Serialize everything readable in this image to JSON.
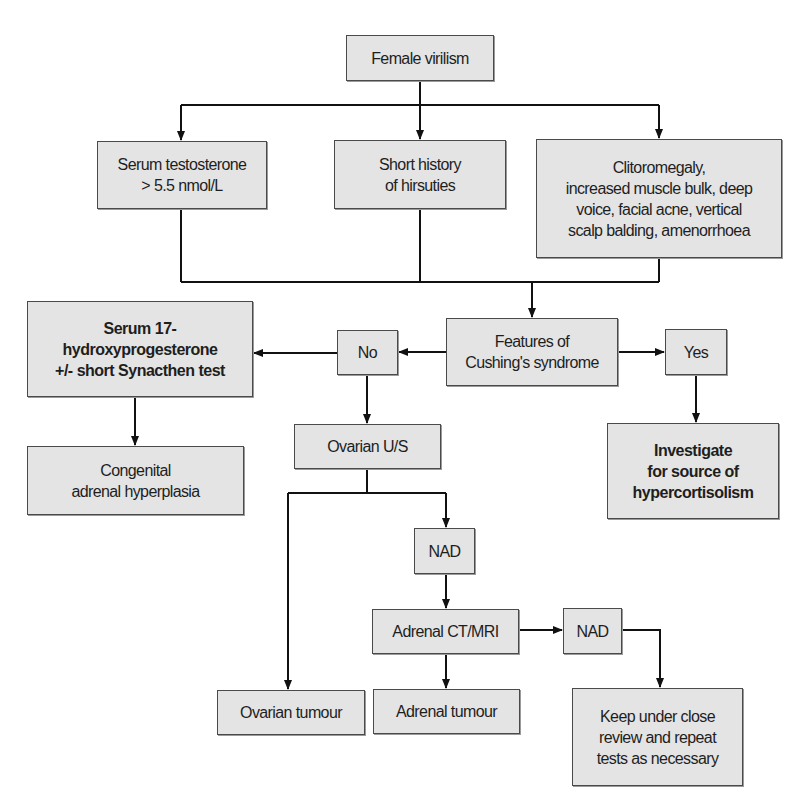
{
  "nodes": {
    "female_virilism": "Female virilism",
    "serum_testosterone": "Serum testosterone\n> 5.5 nmol/L",
    "short_history": "Short history\nof hirsuties",
    "clitoromegaly": "Clitoromegaly,\nincreased muscle bulk, deep\nvoice, facial acne, vertical\nscalp balding, amenorrhoea",
    "features_cushings": "Features of\nCushing's syndrome",
    "no": "No",
    "yes": "Yes",
    "serum_17ohp": "Serum 17-\nhydroxyprogesterone\n+/- short Synacthen test",
    "congenital_adrenal_hyperplasia": "Congenital\nadrenal hyperplasia",
    "ovarian_us": "Ovarian U/S",
    "investigate": "Investigate\nfor source of\nhypercortisolism",
    "nad_1": "NAD",
    "adrenal_ct_mri": "Adrenal CT/MRI",
    "nad_2": "NAD",
    "ovarian_tumour": "Ovarian tumour",
    "adrenal_tumour": "Adrenal tumour",
    "keep_under_review": "Keep under close\nreview and repeat\ntests as necessary"
  },
  "colors": {
    "box_fill": "#e4e4e4",
    "box_border": "#4a4a4a",
    "line": "#111111",
    "text": "#1e1e1e"
  }
}
